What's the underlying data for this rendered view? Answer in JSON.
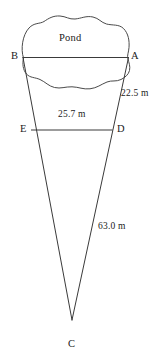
{
  "figure": {
    "background_color": "#ffffff",
    "stroke_color": "#3a3a3a",
    "pond_label": "Pond",
    "vertices": [
      {
        "id": "A",
        "label": "A",
        "x": 128,
        "y": 57
      },
      {
        "id": "B",
        "label": "B",
        "x": 23,
        "y": 57
      },
      {
        "id": "C",
        "label": "C",
        "x": 72,
        "y": 320
      },
      {
        "id": "D",
        "label": "D",
        "x": 112,
        "y": 130
      },
      {
        "id": "E",
        "label": "E",
        "x": 31,
        "y": 130
      }
    ],
    "measurements": [
      {
        "id": "AD",
        "label": "22.5 m",
        "value": 22.5,
        "unit": "m",
        "segment": "A to D"
      },
      {
        "id": "ED",
        "label": "25.7 m",
        "value": 25.7,
        "unit": "m",
        "segment": "E to D"
      },
      {
        "id": "AC",
        "label": "63.0 m",
        "value": 63.0,
        "unit": "m",
        "segment": "A to C"
      }
    ],
    "segments": [
      {
        "id": "BA",
        "from": "B",
        "to": "A",
        "kind": "chord"
      },
      {
        "id": "BC",
        "from": "B",
        "to": "C",
        "kind": "side"
      },
      {
        "id": "AC",
        "from": "A",
        "to": "C",
        "kind": "side"
      },
      {
        "id": "ED",
        "from": "E",
        "to": "D",
        "kind": "chord"
      }
    ]
  }
}
